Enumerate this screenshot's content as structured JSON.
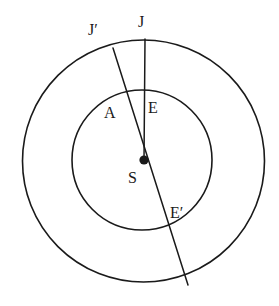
{
  "figure": {
    "type": "geometric-diagram",
    "background_color": "#ffffff",
    "stroke_color": "#1a1a1a",
    "label_color": "#1a1a1a",
    "canvas": {
      "width": 279,
      "height": 306
    }
  },
  "shapes": {
    "outer_circle": {
      "name": "outer-circle",
      "cx": 143.5,
      "cy": 161,
      "r": 121,
      "stroke_width": 1.6
    },
    "inner_circle": {
      "name": "inner-circle",
      "cx": 142,
      "cy": 160,
      "r": 70,
      "stroke_width": 1.6
    },
    "center_point": {
      "name": "center-point-s",
      "cx": 144,
      "cy": 160,
      "r": 4.6
    }
  },
  "lines": [
    {
      "name": "line-j-s",
      "description": "vertical line from J on outer circle through E on inner circle to center S",
      "x1": 145,
      "y1": 39,
      "x2": 144,
      "y2": 160,
      "stroke_width": 1.5
    },
    {
      "name": "line-jprime-eprime",
      "description": "oblique line from J-prime on outer circle through A, center S, E-prime to outer circle",
      "x1": 113,
      "y1": 48,
      "x2": 188,
      "y2": 285,
      "stroke_width": 1.5
    }
  ],
  "labels": [
    {
      "key": "j_prime",
      "text": "J′",
      "x": 88,
      "y": 22
    },
    {
      "key": "j",
      "text": "J",
      "x": 138,
      "y": 14
    },
    {
      "key": "a",
      "text": "A",
      "x": 104,
      "y": 105
    },
    {
      "key": "e",
      "text": "E",
      "x": 148,
      "y": 100
    },
    {
      "key": "s",
      "text": "S",
      "x": 128,
      "y": 170
    },
    {
      "key": "e_prime",
      "text": "E′",
      "x": 170,
      "y": 205
    }
  ]
}
